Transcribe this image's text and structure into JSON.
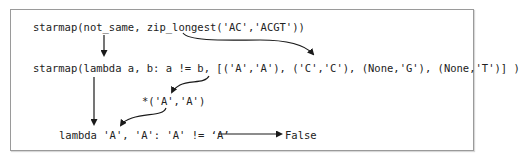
{
  "diagram": {
    "lines": {
      "line1": "starmap(not_same, zip_longest('AC','ACGT'))",
      "line2": "starmap(lambda a, b: a != b, [('A','A'), ('C','C'), (None,'G'), (None,'T')] )",
      "line3": "*('A','A')",
      "line4": "lambda 'A', 'A': 'A' != ‘A’",
      "result": "False"
    },
    "arrows": [
      {
        "from": "line1.starmap",
        "to": "line2.starmap",
        "shape": "straight-down"
      },
      {
        "from": "line1.zip_longest",
        "to": "line2.list",
        "shape": "curved"
      },
      {
        "from": "line2.first_tuple",
        "to": "line3",
        "shape": "curved"
      },
      {
        "from": "line2.starmap",
        "to": "line4",
        "shape": "straight-down"
      },
      {
        "from": "line3",
        "to": "line4.args",
        "shape": "curved"
      },
      {
        "from": "line4",
        "to": "result",
        "shape": "straight-right"
      }
    ],
    "colors": {
      "text": "#222222",
      "arrow": "#1a1a1a",
      "border": "#9a9a9a"
    }
  }
}
